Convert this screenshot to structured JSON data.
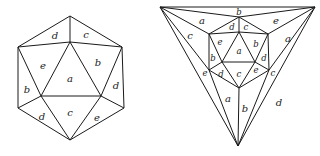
{
  "figures": {
    "left": {
      "title": "icosahedron-view",
      "vertices": {
        "top": [
          70,
          16
        ],
        "ct": [
          70,
          42
        ],
        "ul": [
          18,
          47
        ],
        "ur": [
          122,
          47
        ],
        "ibl": [
          41,
          96
        ],
        "ibr": [
          101,
          96
        ],
        "ll": [
          18,
          108
        ],
        "lr": [
          124,
          108
        ],
        "bot": [
          70,
          140
        ]
      },
      "labels": [
        {
          "text": "d",
          "x": 55,
          "y": 35
        },
        {
          "text": "c",
          "x": 86,
          "y": 34
        },
        {
          "text": "e",
          "x": 43,
          "y": 65
        },
        {
          "text": "a",
          "x": 70,
          "y": 78
        },
        {
          "text": "b",
          "x": 98,
          "y": 62
        },
        {
          "text": "b",
          "x": 27,
          "y": 89
        },
        {
          "text": "d",
          "x": 116,
          "y": 85
        },
        {
          "text": "d",
          "x": 42,
          "y": 116
        },
        {
          "text": "c",
          "x": 70,
          "y": 112
        },
        {
          "text": "e",
          "x": 97,
          "y": 117
        }
      ]
    },
    "right": {
      "title": "icosahedron-schlegel-diagram",
      "vertices": {
        "otl": [
          160,
          7
        ],
        "otr": [
          315,
          7
        ],
        "obot": [
          238,
          146
        ],
        "top": [
          239,
          17
        ],
        "ct": [
          239,
          32
        ],
        "ul": [
          209,
          34
        ],
        "ur": [
          268,
          34
        ],
        "ibl": [
          222,
          62
        ],
        "ibr": [
          255,
          62
        ],
        "ll": [
          209,
          70
        ],
        "lr": [
          269,
          70
        ],
        "bot": [
          239,
          88
        ]
      },
      "labels": [
        {
          "text": "b",
          "x": 239,
          "y": 12,
          "size": "s"
        },
        {
          "text": "a",
          "x": 202,
          "y": 20
        },
        {
          "text": "e",
          "x": 276,
          "y": 20
        },
        {
          "text": "c",
          "x": 190,
          "y": 35
        },
        {
          "text": "a",
          "x": 288,
          "y": 38
        },
        {
          "text": "d",
          "x": 232,
          "y": 27,
          "size": "s"
        },
        {
          "text": "c",
          "x": 246,
          "y": 27,
          "size": "s"
        },
        {
          "text": "e",
          "x": 220,
          "y": 42,
          "size": "s"
        },
        {
          "text": "a",
          "x": 239,
          "y": 51,
          "size": "s"
        },
        {
          "text": "b",
          "x": 256,
          "y": 44,
          "size": "s"
        },
        {
          "text": "b",
          "x": 213,
          "y": 58,
          "size": "s"
        },
        {
          "text": "d",
          "x": 264,
          "y": 58,
          "size": "s"
        },
        {
          "text": "e",
          "x": 205,
          "y": 73,
          "size": "s"
        },
        {
          "text": "d",
          "x": 221,
          "y": 74,
          "size": "s"
        },
        {
          "text": "c",
          "x": 239,
          "y": 74,
          "size": "s"
        },
        {
          "text": "e",
          "x": 256,
          "y": 70,
          "size": "s"
        },
        {
          "text": "c",
          "x": 273,
          "y": 73,
          "size": "s"
        },
        {
          "text": "a",
          "x": 228,
          "y": 98
        },
        {
          "text": "b",
          "x": 245,
          "y": 108
        },
        {
          "text": "d",
          "x": 279,
          "y": 102
        }
      ]
    }
  }
}
